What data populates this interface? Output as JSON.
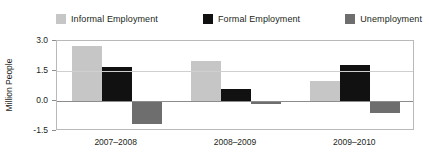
{
  "chart_data": {
    "type": "bar",
    "title": "",
    "subtitle": "",
    "xlabel": "",
    "ylabel": "Million People",
    "categories": [
      "2007–2008",
      "2008–2009",
      "2009–2010"
    ],
    "series": [
      {
        "name": "Informal Employment",
        "color": "#c6c6c6",
        "values": [
          2.75,
          2.0,
          1.0
        ]
      },
      {
        "name": "Formal Employment",
        "color": "#111111",
        "values": [
          1.7,
          0.6,
          1.8
        ]
      },
      {
        "name": "Unemployment",
        "color": "#6e6e6e",
        "values": [
          -1.15,
          -0.15,
          -0.6
        ]
      }
    ],
    "ylim": [
      -1.5,
      3.0
    ],
    "y_ticks": [
      "3.0",
      "1.5",
      "0.0",
      "-1.5"
    ],
    "y_tick_values": [
      3.0,
      1.5,
      0.0,
      -1.5
    ],
    "grid": true,
    "legend_position": "top"
  },
  "colors": {
    "informal": "#c6c6c6",
    "formal": "#111111",
    "unemployment": "#6e6e6e",
    "frame": "#b9b9b9",
    "gridline": "#cfcfcf",
    "zeroline": "#8c8c8c",
    "text": "#231f20",
    "background": "#ffffff"
  }
}
